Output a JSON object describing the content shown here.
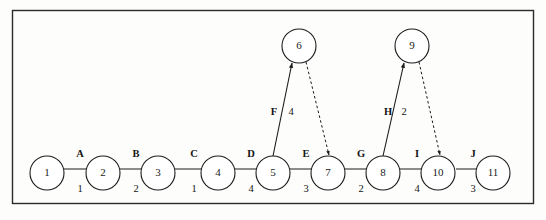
{
  "figure": {
    "type": "activity-on-arrow-network-diagram",
    "frame": {
      "x": 12,
      "y": 10,
      "width": 522,
      "height": 194
    },
    "nodes": [
      {
        "id": "node-1",
        "label": "1",
        "cx": 47,
        "cy": 173,
        "r": 17
      },
      {
        "id": "node-2",
        "label": "2",
        "cx": 103,
        "cy": 173,
        "r": 17
      },
      {
        "id": "node-3",
        "label": "3",
        "cx": 158,
        "cy": 173,
        "r": 17
      },
      {
        "id": "node-4",
        "label": "4",
        "cx": 218,
        "cy": 173,
        "r": 17
      },
      {
        "id": "node-5",
        "label": "5",
        "cx": 273,
        "cy": 173,
        "r": 17
      },
      {
        "id": "node-6",
        "label": "6",
        "cx": 299,
        "cy": 46,
        "r": 17
      },
      {
        "id": "node-7",
        "label": "7",
        "cx": 328,
        "cy": 173,
        "r": 17
      },
      {
        "id": "node-8",
        "label": "8",
        "cx": 383,
        "cy": 173,
        "r": 17
      },
      {
        "id": "node-9",
        "label": "9",
        "cx": 412,
        "cy": 46,
        "r": 17
      },
      {
        "id": "node-10",
        "label": "10",
        "cx": 438,
        "cy": 173,
        "r": 17
      },
      {
        "id": "node-11",
        "label": "11",
        "cx": 493,
        "cy": 173,
        "r": 17
      }
    ],
    "edges": [
      {
        "id": "edge-A",
        "from": "1",
        "to": "2",
        "name": "A",
        "duration": "1",
        "style": "solid",
        "x1": 64,
        "y1": 169,
        "x2": 101,
        "y2": 169,
        "name_x": 80,
        "name_y": 155,
        "dur_x": 80,
        "dur_y": 190
      },
      {
        "id": "edge-B",
        "from": "2",
        "to": "3",
        "name": "B",
        "duration": "2",
        "style": "solid",
        "x1": 120,
        "y1": 169,
        "x2": 156,
        "y2": 169,
        "name_x": 136,
        "name_y": 155,
        "dur_x": 136,
        "dur_y": 190
      },
      {
        "id": "edge-C",
        "from": "3",
        "to": "4",
        "name": "C",
        "duration": "1",
        "style": "solid",
        "x1": 175,
        "y1": 169,
        "x2": 216,
        "y2": 169,
        "name_x": 194,
        "name_y": 155,
        "dur_x": 194,
        "dur_y": 190
      },
      {
        "id": "edge-D",
        "from": "4",
        "to": "5",
        "name": "D",
        "duration": "4",
        "style": "solid",
        "x1": 235,
        "y1": 169,
        "x2": 271,
        "y2": 169,
        "name_x": 251,
        "name_y": 155,
        "dur_x": 251,
        "dur_y": 190
      },
      {
        "id": "edge-E",
        "from": "5",
        "to": "7",
        "name": "E",
        "duration": "3",
        "style": "solid",
        "x1": 290,
        "y1": 169,
        "x2": 326,
        "y2": 169,
        "name_x": 306,
        "name_y": 155,
        "dur_x": 306,
        "dur_y": 190
      },
      {
        "id": "edge-F",
        "from": "5",
        "to": "6",
        "name": "F",
        "duration": "4",
        "style": "solid",
        "x1": 273,
        "y1": 156,
        "x2": 292,
        "y2": 63,
        "name_x": 274,
        "name_y": 113,
        "dur_x": 291,
        "dur_y": 113
      },
      {
        "id": "edge-G",
        "from": "7",
        "to": "8",
        "name": "G",
        "duration": "2",
        "style": "solid",
        "x1": 345,
        "y1": 169,
        "x2": 381,
        "y2": 169,
        "name_x": 361,
        "name_y": 155,
        "dur_x": 361,
        "dur_y": 190
      },
      {
        "id": "edge-H",
        "from": "8",
        "to": "9",
        "name": "H",
        "duration": "2",
        "style": "solid",
        "x1": 383,
        "y1": 156,
        "x2": 404,
        "y2": 63,
        "name_x": 388,
        "name_y": 113,
        "dur_x": 404,
        "dur_y": 113
      },
      {
        "id": "edge-I",
        "from": "8",
        "to": "10",
        "name": "I",
        "duration": "4",
        "style": "solid",
        "x1": 400,
        "y1": 169,
        "x2": 436,
        "y2": 169,
        "name_x": 417,
        "name_y": 155,
        "dur_x": 417,
        "dur_y": 190
      },
      {
        "id": "edge-J",
        "from": "10",
        "to": "11",
        "name": "J",
        "duration": "3",
        "style": "solid",
        "x1": 456,
        "y1": 169,
        "x2": 491,
        "y2": 169,
        "name_x": 473,
        "name_y": 155,
        "dur_x": 473,
        "dur_y": 190
      },
      {
        "id": "edge-dummy-6-7",
        "from": "6",
        "to": "7",
        "name": "",
        "duration": "",
        "style": "dashed",
        "x1": 306,
        "y1": 62,
        "x2": 329,
        "y2": 155,
        "name_x": null,
        "name_y": null,
        "dur_x": null,
        "dur_y": null
      },
      {
        "id": "edge-dummy-9-10",
        "from": "9",
        "to": "10",
        "name": "",
        "duration": "",
        "style": "dashed",
        "x1": 419,
        "y1": 62,
        "x2": 440,
        "y2": 155,
        "name_x": null,
        "name_y": null,
        "dur_x": null,
        "dur_y": null
      }
    ],
    "colors": {
      "stroke": "#1c1c1c",
      "frame": "#2b2b2b",
      "text": "#141414",
      "background": "#fdfdfb"
    }
  }
}
